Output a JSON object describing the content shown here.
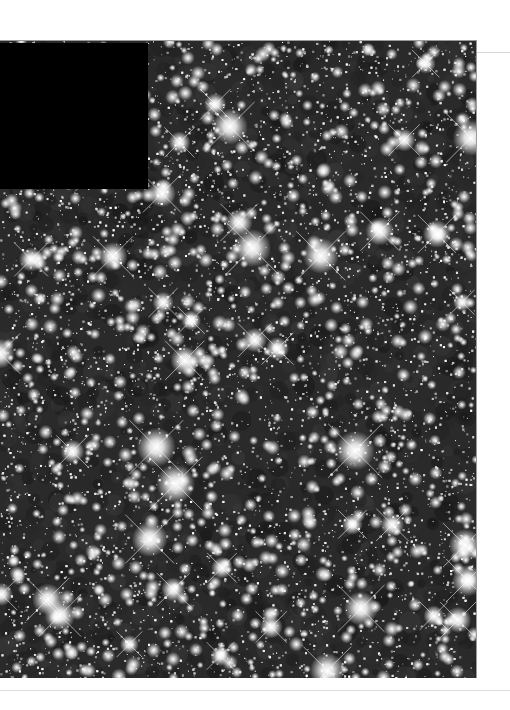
{
  "image": {
    "subject": "dense star cluster field",
    "background_color": "#2a2a2a",
    "star_color": "#ffffff",
    "masked_region": {
      "color": "#000000",
      "x": 0,
      "y": 2,
      "width": 148,
      "height": 146
    },
    "field": {
      "width": 476,
      "height": 637,
      "seed": 1337,
      "faint_stars": 9000,
      "medium_stars": 900,
      "bright_stars": 45
    }
  }
}
